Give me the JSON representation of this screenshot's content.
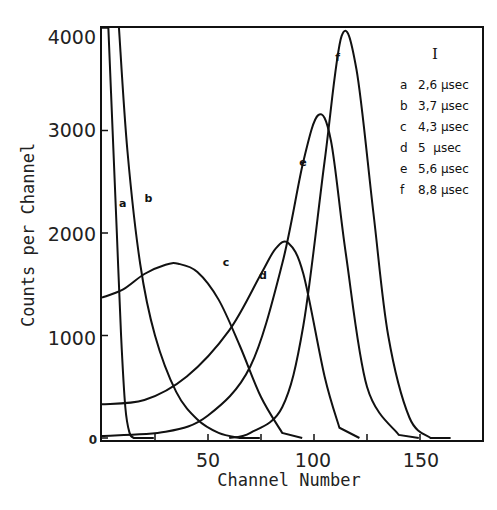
{
  "chart_data": {
    "type": "line",
    "title": "",
    "xlabel": "Channel Number",
    "ylabel": "Counts per Channel",
    "xlim": [
      0,
      180
    ],
    "ylim": [
      0,
      4000
    ],
    "x_ticks": [
      50,
      100,
      150
    ],
    "x_minor_ticks": [
      25,
      75,
      125
    ],
    "y_ticks": [
      0,
      1000,
      2000,
      3000,
      4000
    ],
    "grid": false,
    "legend": {
      "title": "I",
      "position": "upper right",
      "entries": [
        {
          "key": "a",
          "label": "2,6 μsec"
        },
        {
          "key": "b",
          "label": "3,7 μsec"
        },
        {
          "key": "c",
          "label": "4,3 μsec"
        },
        {
          "key": "d",
          "label": "5 μsec"
        },
        {
          "key": "e",
          "label": "5,6 μsec"
        },
        {
          "key": "f",
          "label": "8,8 μsec"
        }
      ]
    },
    "series": [
      {
        "name": "a",
        "x": [
          3,
          5,
          7,
          9,
          11,
          13,
          15
        ],
        "y": [
          4000,
          3000,
          2000,
          1000,
          300,
          50,
          0
        ]
      },
      {
        "name": "b",
        "x": [
          8,
          12,
          18,
          25,
          35,
          45,
          55,
          65
        ],
        "y": [
          4000,
          2800,
          1700,
          1000,
          450,
          180,
          50,
          0
        ]
      },
      {
        "name": "c",
        "x": [
          0,
          10,
          20,
          30,
          36,
          45,
          55,
          65,
          75,
          85
        ],
        "y": [
          1370,
          1450,
          1600,
          1690,
          1700,
          1620,
          1350,
          900,
          400,
          50
        ]
      },
      {
        "name": "d",
        "x": [
          0,
          20,
          40,
          60,
          75,
          82,
          88,
          95,
          105,
          112
        ],
        "y": [
          330,
          370,
          600,
          1050,
          1600,
          1850,
          1900,
          1600,
          600,
          100
        ]
      },
      {
        "name": "e",
        "x": [
          0,
          30,
          50,
          70,
          85,
          95,
          102,
          108,
          115,
          125,
          140
        ],
        "y": [
          20,
          60,
          220,
          700,
          1700,
          2700,
          3150,
          2900,
          1800,
          500,
          30
        ]
      },
      {
        "name": "f",
        "x": [
          60,
          70,
          85,
          95,
          105,
          113,
          120,
          128,
          135,
          145,
          155
        ],
        "y": [
          0,
          50,
          300,
          1100,
          2700,
          3920,
          3600,
          2200,
          1000,
          200,
          0
        ]
      }
    ],
    "curve_labels": [
      {
        "key": "a",
        "x": 8,
        "y": 2250
      },
      {
        "key": "b",
        "x": 20,
        "y": 2300
      },
      {
        "key": "c",
        "x": 57,
        "y": 1680
      },
      {
        "key": "d",
        "x": 74,
        "y": 1550
      },
      {
        "key": "e",
        "x": 93,
        "y": 2650
      },
      {
        "key": "f",
        "x": 110,
        "y": 3680
      }
    ]
  },
  "axes": {
    "x_tick_labels": [
      "50",
      "100",
      "150"
    ],
    "y_tick_labels": [
      "4000",
      "3000",
      "2000",
      "1000",
      "0"
    ],
    "x_title": "Channel Number",
    "y_title": "Counts per Channel"
  },
  "legend": {
    "title": "I",
    "keys": [
      "a",
      "b",
      "c",
      "d",
      "e",
      "f"
    ],
    "values": [
      "2,6 μsec",
      "3,7 μsec",
      "4,3 μsec",
      "5  μsec",
      "5,6 μsec",
      "8,8 μsec"
    ]
  }
}
